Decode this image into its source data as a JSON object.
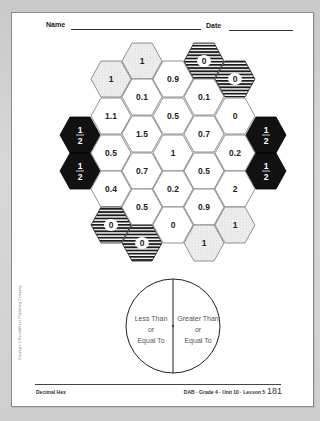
{
  "header": {
    "name_label": "Name",
    "date_label": "Date"
  },
  "hex_board": {
    "hex_width": 40,
    "hex_height": 36,
    "cells": [
      {
        "col": 0,
        "cx": 80,
        "cy": 135,
        "label": "1/2",
        "style": "black"
      },
      {
        "col": 0,
        "cx": 80,
        "cy": 171,
        "label": "1/2",
        "style": "black"
      },
      {
        "col": 1,
        "cx": 111,
        "cy": 79,
        "label": "1",
        "style": "dotted"
      },
      {
        "col": 1,
        "cx": 111,
        "cy": 116,
        "label": "1.1",
        "style": "white"
      },
      {
        "col": 1,
        "cx": 111,
        "cy": 153,
        "label": "0.5",
        "style": "white"
      },
      {
        "col": 1,
        "cx": 111,
        "cy": 189,
        "label": "0.4",
        "style": "white"
      },
      {
        "col": 1,
        "cx": 111,
        "cy": 225,
        "label": "0",
        "style": "striped"
      },
      {
        "col": 2,
        "cx": 142,
        "cy": 61,
        "label": "1",
        "style": "dotted"
      },
      {
        "col": 2,
        "cx": 142,
        "cy": 97,
        "label": "0.1",
        "style": "white"
      },
      {
        "col": 2,
        "cx": 142,
        "cy": 134,
        "label": "1.5",
        "style": "white"
      },
      {
        "col": 2,
        "cx": 142,
        "cy": 171,
        "label": "0.7",
        "style": "white"
      },
      {
        "col": 2,
        "cx": 142,
        "cy": 207,
        "label": "0.5",
        "style": "white"
      },
      {
        "col": 2,
        "cx": 142,
        "cy": 243,
        "label": "0",
        "style": "striped"
      },
      {
        "col": 3,
        "cx": 173,
        "cy": 79,
        "label": "0.9",
        "style": "white"
      },
      {
        "col": 3,
        "cx": 173,
        "cy": 116,
        "label": "0.5",
        "style": "white"
      },
      {
        "col": 3,
        "cx": 173,
        "cy": 153,
        "label": "1",
        "style": "white"
      },
      {
        "col": 3,
        "cx": 173,
        "cy": 189,
        "label": "0.2",
        "style": "white"
      },
      {
        "col": 3,
        "cx": 173,
        "cy": 225,
        "label": "0",
        "style": "white"
      },
      {
        "col": 4,
        "cx": 204,
        "cy": 61,
        "label": "0",
        "style": "striped"
      },
      {
        "col": 4,
        "cx": 204,
        "cy": 97,
        "label": "0.1",
        "style": "white"
      },
      {
        "col": 4,
        "cx": 204,
        "cy": 134,
        "label": "0.7",
        "style": "white"
      },
      {
        "col": 4,
        "cx": 204,
        "cy": 171,
        "label": "0.5",
        "style": "white"
      },
      {
        "col": 4,
        "cx": 204,
        "cy": 207,
        "label": "0.9",
        "style": "white"
      },
      {
        "col": 4,
        "cx": 204,
        "cy": 243,
        "label": "1",
        "style": "dotted"
      },
      {
        "col": 5,
        "cx": 235,
        "cy": 79,
        "label": "0",
        "style": "striped"
      },
      {
        "col": 5,
        "cx": 235,
        "cy": 116,
        "label": "0",
        "style": "white"
      },
      {
        "col": 5,
        "cx": 235,
        "cy": 153,
        "label": "0.2",
        "style": "white"
      },
      {
        "col": 5,
        "cx": 235,
        "cy": 189,
        "label": "2",
        "style": "white"
      },
      {
        "col": 5,
        "cx": 235,
        "cy": 225,
        "label": "1",
        "style": "dotted"
      },
      {
        "col": 6,
        "cx": 266,
        "cy": 135,
        "label": "1/2",
        "style": "black"
      },
      {
        "col": 6,
        "cx": 266,
        "cy": 171,
        "label": "1/2",
        "style": "black"
      }
    ]
  },
  "sorting_circle": {
    "left_label": [
      "Less Than",
      "or",
      "Equal To"
    ],
    "right_label": [
      "Greater Than",
      "or",
      "Equal To"
    ]
  },
  "copyright": "Copyright © Kendall/Hunt Publishing Company",
  "footer": {
    "title": "Decimal Hex",
    "course": "DAB · Grade 4 · Unit 10 · Lesson 5",
    "page_number": "181"
  },
  "colors": {
    "black_hex": "#111111",
    "dotted_hex_bg": "#ececec",
    "stripe": "#1a1a1a",
    "outline": "#777777"
  }
}
